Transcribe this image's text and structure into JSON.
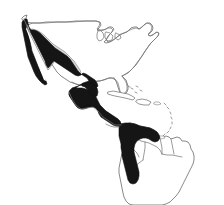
{
  "figure": {
    "type": "distribution-range-map",
    "region": "Americas",
    "background_color": "#ffffff",
    "width": 224,
    "height": 205,
    "title": "",
    "caption": "",
    "has_border_frame": false,
    "has_legend": false,
    "has_scale_bar": false,
    "has_labels": false
  },
  "colors": {
    "range_primary": "#151515",
    "range_secondary": "#d9d9d9",
    "coastline_stroke": "#6b6b6b",
    "border_stroke": "#7a7a7a",
    "land_fill": "#ffffff",
    "ocean_fill": "#ffffff"
  },
  "layers": {
    "range_primary": {
      "name": "primary-range-shading",
      "fill": "#151515",
      "description": "Solid black range covering Mexican coastal lowlands, Baja California, all of Central America and northern South America"
    },
    "range_secondary": {
      "name": "secondary-range-shading",
      "fill": "#d9d9d9",
      "description": "Light grey inset region on the Mexican Plateau interior"
    },
    "coastline": {
      "name": "coastline-outline",
      "description": "Thin grey outline of North America, the Caribbean and South America"
    }
  },
  "landmasses": [
    {
      "id": "north-america",
      "label": "North America",
      "shaded": false
    },
    {
      "id": "mexico",
      "label": "Mexico",
      "shaded": true,
      "shading": "primary-and-secondary"
    },
    {
      "id": "central-america",
      "label": "Central America",
      "shaded": true,
      "shading": "primary"
    },
    {
      "id": "south-america",
      "label": "South America",
      "shaded": true,
      "shading": "primary-north-only"
    }
  ],
  "islands": [
    {
      "id": "cuba",
      "label": "Cuba",
      "shaded": false
    },
    {
      "id": "hispaniola",
      "label": "Hispaniola",
      "shaded": false
    },
    {
      "id": "jamaica",
      "label": "Jamaica",
      "shaded": false
    },
    {
      "id": "puerto-rico",
      "label": "Puerto Rico",
      "shaded": false
    },
    {
      "id": "lesser-antilles",
      "label": "Lesser Antilles",
      "shaded": false
    },
    {
      "id": "trinidad",
      "label": "Trinidad",
      "shaded": false
    }
  ]
}
